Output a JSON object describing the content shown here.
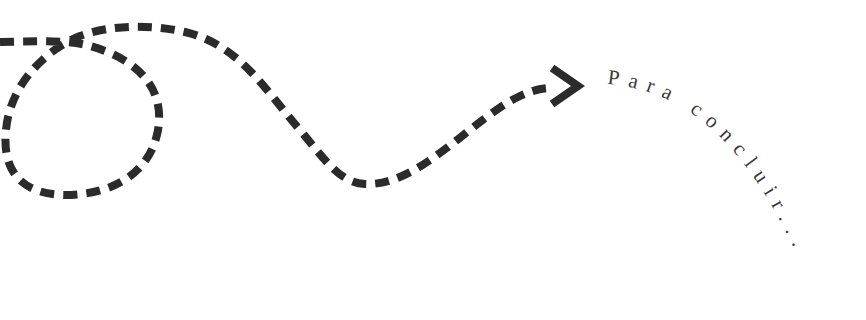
{
  "diagram": {
    "caption": "Para concluir...",
    "stroke_color": "#2b2b2b",
    "background": "#ffffff",
    "elements": [
      {
        "type": "dashed-path",
        "description": "looping dashed line ending in arrow"
      },
      {
        "type": "arrowhead",
        "direction": "right"
      },
      {
        "type": "curved-text",
        "text": "Para concluir..."
      }
    ]
  }
}
